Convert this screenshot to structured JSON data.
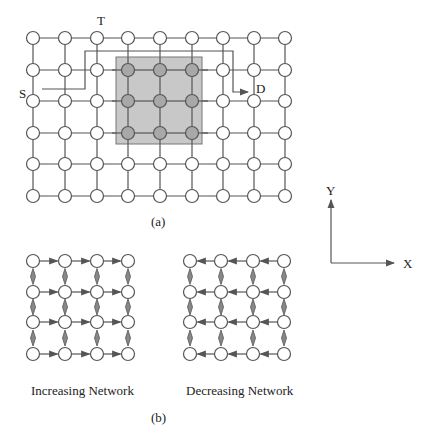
{
  "figure_a": {
    "caption": "(a)",
    "labels": {
      "source": "S",
      "turn": "T",
      "destination": "D"
    },
    "grid": {
      "cols": [
        33,
        65,
        97,
        128,
        160,
        192,
        223,
        254,
        285
      ],
      "rows": [
        38,
        70,
        101,
        133,
        164,
        196
      ]
    },
    "faulty_region": {
      "x": 116,
      "y": 57,
      "w": 86,
      "h": 87,
      "color": "#c8c8c8"
    },
    "route": [
      [
        42,
        89
      ],
      [
        85,
        89
      ],
      [
        85,
        51
      ],
      [
        233,
        51
      ],
      [
        233,
        92
      ],
      [
        248,
        92
      ]
    ]
  },
  "axes": {
    "x_label": "X",
    "y_label": "Y"
  },
  "figure_b": {
    "caption": "(b)",
    "increasing": {
      "title": "Increasing Network",
      "cols": [
        33,
        65,
        97,
        128
      ],
      "rows": [
        261,
        292,
        322,
        354
      ]
    },
    "decreasing": {
      "title": "Decreasing Network",
      "cols": [
        190,
        221,
        253,
        284
      ],
      "rows": [
        261,
        292,
        322,
        354
      ]
    }
  },
  "colors": {
    "line": "#555555",
    "node_fill": "#ffffff",
    "shaded_node": "#a8a8a8"
  }
}
